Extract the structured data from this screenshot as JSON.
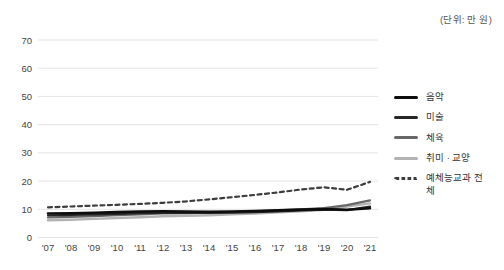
{
  "unit_label": "(단위: 만 원)",
  "chart_data": {
    "type": "line",
    "title": "",
    "xlabel": "",
    "ylabel": "",
    "unit": "만 원",
    "ylim": [
      0,
      70
    ],
    "ytick_step": 10,
    "yticks": [
      0,
      10,
      20,
      30,
      40,
      50,
      60,
      70
    ],
    "grid": true,
    "legend_position": "right",
    "categories": [
      "'07",
      "'08",
      "'09",
      "'10",
      "'11",
      "'12",
      "'13",
      "'14",
      "'15",
      "'16",
      "'17",
      "'18",
      "'19",
      "'20",
      "'21"
    ],
    "series": [
      {
        "name": "음악",
        "color": "#0d0d0d",
        "width": 2.6,
        "dashed": false,
        "values": [
          8.5,
          8.6,
          8.8,
          9.0,
          9.2,
          9.3,
          9.2,
          9.1,
          9.2,
          9.4,
          9.6,
          9.9,
          10.1,
          9.8,
          10.4
        ]
      },
      {
        "name": "미술",
        "color": "#262626",
        "width": 2.2,
        "dashed": false,
        "values": [
          7.8,
          8.0,
          8.2,
          8.4,
          8.6,
          8.8,
          8.7,
          8.7,
          8.8,
          9.0,
          9.3,
          9.6,
          9.9,
          9.7,
          10.9
        ]
      },
      {
        "name": "체육",
        "color": "#686868",
        "width": 2.2,
        "dashed": false,
        "values": [
          7.1,
          7.3,
          7.6,
          7.9,
          8.2,
          8.5,
          8.6,
          8.8,
          9.0,
          9.3,
          9.6,
          10.0,
          10.4,
          11.5,
          13.2
        ]
      },
      {
        "name": "취미 · 교양",
        "color": "#b3b3b3",
        "width": 2.4,
        "dashed": false,
        "values": [
          6.1,
          6.3,
          6.6,
          6.9,
          7.2,
          7.5,
          7.7,
          7.9,
          8.2,
          8.5,
          8.9,
          9.3,
          9.8,
          11.0,
          12.1
        ]
      },
      {
        "name": "예체능교과 전체",
        "color": "#3d3d3d",
        "width": 2.2,
        "dashed": true,
        "values": [
          10.7,
          11.0,
          11.3,
          11.6,
          11.9,
          12.3,
          12.8,
          13.5,
          14.3,
          15.1,
          16.0,
          17.0,
          17.8,
          16.9,
          19.7
        ]
      }
    ]
  }
}
